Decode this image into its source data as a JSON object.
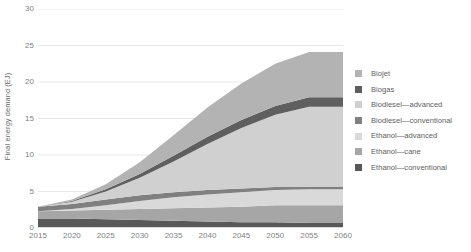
{
  "chart_data": {
    "type": "area",
    "stacked": true,
    "title": "",
    "xlabel": "",
    "ylabel": "Final energy demand (EJ)",
    "x": [
      2015,
      2020,
      2025,
      2030,
      2035,
      2040,
      2045,
      2050,
      2055,
      2060
    ],
    "xlim": [
      2015,
      2060
    ],
    "ylim": [
      0,
      30
    ],
    "yticks": [
      0,
      5,
      10,
      15,
      20,
      25,
      30
    ],
    "xticks": [
      2015,
      2020,
      2025,
      2030,
      2035,
      2040,
      2045,
      2050,
      2055,
      2060
    ],
    "grid": "horizontal",
    "legend_position": "right",
    "series": [
      {
        "name": "Ethanol—conventional",
        "color": "#595959",
        "values": [
          1.3,
          1.3,
          1.2,
          1.1,
          1.0,
          0.9,
          0.8,
          0.8,
          0.7,
          0.7
        ]
      },
      {
        "name": "Ethanol—cane",
        "color": "#a6a6a6",
        "values": [
          1.0,
          1.1,
          1.3,
          1.5,
          1.7,
          1.9,
          2.1,
          2.3,
          2.4,
          2.4
        ]
      },
      {
        "name": "Ethanol—advanced",
        "color": "#d9d9d9",
        "values": [
          0.0,
          0.2,
          0.6,
          1.1,
          1.5,
          1.8,
          2.0,
          2.1,
          2.2,
          2.2
        ]
      },
      {
        "name": "Biodiesel—conventional",
        "color": "#808080",
        "values": [
          0.6,
          0.7,
          0.8,
          0.8,
          0.7,
          0.6,
          0.5,
          0.4,
          0.3,
          0.3
        ]
      },
      {
        "name": "Biodiesel—advanced",
        "color": "#d0d0d0",
        "values": [
          0.0,
          0.3,
          1.1,
          2.4,
          4.2,
          6.3,
          8.3,
          9.9,
          11.0,
          11.0
        ]
      },
      {
        "name": "Biogas",
        "color": "#5f5f5f",
        "values": [
          0.0,
          0.1,
          0.3,
          0.5,
          0.8,
          1.0,
          1.1,
          1.2,
          1.3,
          1.3
        ]
      },
      {
        "name": "Biojet",
        "color": "#b3b3b3",
        "values": [
          0.0,
          0.2,
          0.7,
          1.6,
          2.8,
          4.0,
          5.0,
          5.8,
          6.2,
          6.2
        ]
      }
    ],
    "totals": [
      2.9,
      3.9,
      6.0,
      9.0,
      12.7,
      16.5,
      19.8,
      22.5,
      24.1,
      24.1
    ]
  },
  "legend": {
    "items": [
      {
        "label": "Biojet",
        "color": "#b3b3b3"
      },
      {
        "label": "Biogas",
        "color": "#5f5f5f"
      },
      {
        "label": "Biodiesel—advanced",
        "color": "#d0d0d0"
      },
      {
        "label": "Biodiesel—conventional",
        "color": "#808080"
      },
      {
        "label": "Ethanol—advanced",
        "color": "#d9d9d9"
      },
      {
        "label": "Ethanol—cane",
        "color": "#a6a6a6"
      },
      {
        "label": "Ethanol—conventional",
        "color": "#595959"
      }
    ]
  },
  "axes": {
    "y_title": "Final energy demand (EJ)",
    "y_labels": [
      "30",
      "25",
      "20",
      "15",
      "10",
      "5",
      "0"
    ],
    "x_labels": [
      "2015",
      "2020",
      "2025",
      "2030",
      "2035",
      "2040",
      "2045",
      "2050",
      "2055",
      "2060"
    ]
  },
  "style": {
    "gridline_color": "#e8e8e8",
    "tick_text_color": "#7f7f7f",
    "background": "#ffffff"
  }
}
